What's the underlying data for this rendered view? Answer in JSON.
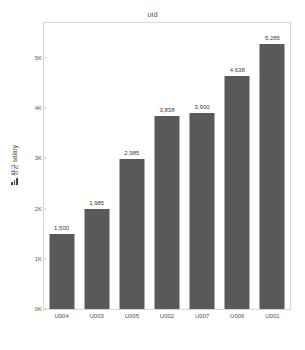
{
  "chart_data": {
    "type": "bar",
    "title": "uid",
    "xlabel": "",
    "ylabel": "평균 salary",
    "ylabel_icon": "bar-chart-icon",
    "categories": [
      "U004",
      "U003",
      "U005",
      "U002",
      "U007",
      "U006",
      "U001"
    ],
    "values": [
      1500,
      1985,
      2985,
      3838,
      3900,
      4638,
      5285
    ],
    "value_labels": [
      "1,500",
      "1,985",
      "2,985",
      "3,838",
      "3,900",
      "4,638",
      "5,285"
    ],
    "ylim": [
      0,
      5700
    ],
    "yticks": [
      0,
      1000,
      2000,
      3000,
      4000,
      5000
    ],
    "ytick_labels": [
      "0K",
      "1K",
      "2K",
      "3K",
      "4K",
      "5K"
    ],
    "grid": false,
    "legend": "none",
    "bar_color": "#595959",
    "plot_background": "#ffffff",
    "frame_color": "#d6d6d6",
    "text_color": "#4f4f4f"
  }
}
